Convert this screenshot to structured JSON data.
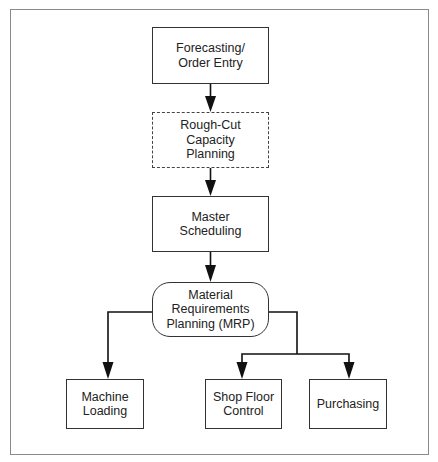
{
  "diagram": {
    "type": "flowchart",
    "nodes": {
      "forecasting": {
        "label": "Forecasting/\nOrder Entry",
        "style": "solid-rect"
      },
      "rough_cut": {
        "label": "Rough-Cut\nCapacity\nPlanning",
        "style": "dashed-rect"
      },
      "master_scheduling": {
        "label": "Master\nScheduling",
        "style": "solid-rect"
      },
      "mrp": {
        "label": "Material\nRequirements\nPlanning (MRP)",
        "style": "rounded-rect"
      },
      "machine_loading": {
        "label": "Machine\nLoading",
        "style": "solid-rect"
      },
      "shop_floor": {
        "label": "Shop Floor\nControl",
        "style": "solid-rect"
      },
      "purchasing": {
        "label": "Purchasing",
        "style": "solid-rect"
      }
    },
    "edges": [
      {
        "from": "forecasting",
        "to": "rough_cut"
      },
      {
        "from": "rough_cut",
        "to": "master_scheduling"
      },
      {
        "from": "master_scheduling",
        "to": "mrp"
      },
      {
        "from": "mrp",
        "to": "machine_loading"
      },
      {
        "from": "mrp",
        "to": "shop_floor"
      },
      {
        "from": "mrp",
        "to": "purchasing"
      }
    ],
    "colors": {
      "frame": "#8a8a8a",
      "stroke": "#333333",
      "arrow": "#111111",
      "text": "#222222",
      "background": "#ffffff"
    }
  }
}
